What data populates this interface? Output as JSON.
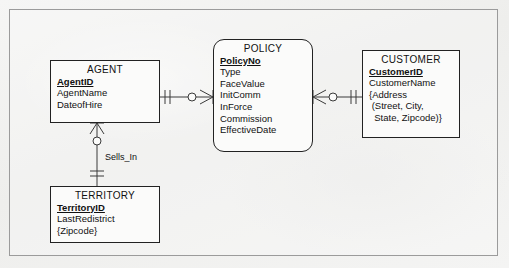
{
  "diagram": {
    "type": "entity-relationship-diagram",
    "notation": "crow's foot",
    "title": "",
    "frame_color": "#9b9b9b",
    "background_color": "#f2f2f1",
    "entity_fill": "#fbfbfa",
    "entity_border": "#222222",
    "line_color": "#3a3a3a"
  },
  "entities": [
    {
      "id": "agent",
      "name": "AGENT",
      "shape": "rectangle",
      "attributes": [
        {
          "label": "AgentID",
          "key": "primary"
        },
        {
          "label": "AgentName",
          "key": "none"
        },
        {
          "label": "DateofHire",
          "key": "none"
        }
      ]
    },
    {
      "id": "policy",
      "name": "POLICY",
      "shape": "rounded-rectangle",
      "attributes": [
        {
          "label": "PolicyNo",
          "key": "primary"
        },
        {
          "label": "Type",
          "key": "none"
        },
        {
          "label": "FaceValue",
          "key": "none"
        },
        {
          "label": "InitComm",
          "key": "none"
        },
        {
          "label": "InForce",
          "key": "none"
        },
        {
          "label": "Commission",
          "key": "none"
        },
        {
          "label": "EffectiveDate",
          "key": "none"
        }
      ]
    },
    {
      "id": "customer",
      "name": "CUSTOMER",
      "shape": "rectangle",
      "attributes": [
        {
          "label": "CustomerID",
          "key": "primary"
        },
        {
          "label": "CustomerName",
          "key": "none"
        },
        {
          "label": "{Address",
          "key": "none"
        },
        {
          "label": " (Street, City,",
          "key": "none"
        },
        {
          "label": "  State, Zipcode)}",
          "key": "none"
        }
      ]
    },
    {
      "id": "territory",
      "name": "TERRITORY",
      "shape": "rectangle",
      "attributes": [
        {
          "label": "TerritoryID",
          "key": "primary"
        },
        {
          "label": "LastRedistrict",
          "key": "none"
        },
        {
          "label": "{Zipcode}",
          "key": "none"
        }
      ]
    }
  ],
  "relationships": [
    {
      "id": "agent-policy",
      "label": "",
      "from": "agent",
      "to": "policy",
      "from_cardinality": "one-and-only-one",
      "to_cardinality": "zero-or-many"
    },
    {
      "id": "policy-customer",
      "label": "",
      "from": "policy",
      "to": "customer",
      "from_cardinality": "zero-or-many",
      "to_cardinality": "one-and-only-one"
    },
    {
      "id": "agent-territory",
      "label": "Sells_In",
      "from": "agent",
      "to": "territory",
      "from_cardinality": "zero-or-many",
      "to_cardinality": "one-and-only-one"
    }
  ]
}
